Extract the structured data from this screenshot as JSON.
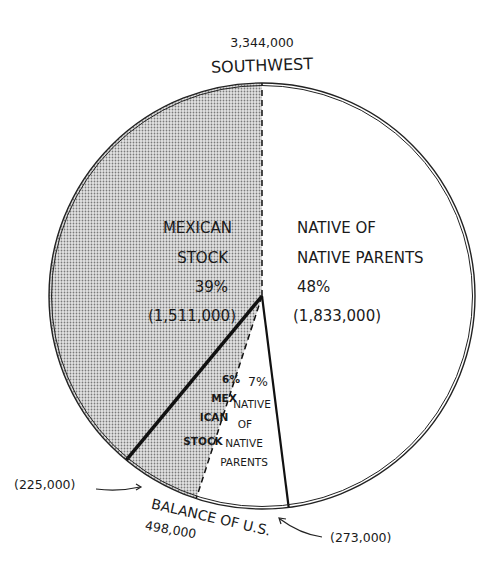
{
  "chart_data": {
    "type": "pie",
    "title": "",
    "start_angle_deg": 0,
    "direction": "clockwise",
    "groups": [
      {
        "name": "Southwest",
        "total_label": "3,344,000",
        "label": "SOUTHWEST",
        "position": "top"
      },
      {
        "name": "Balance of U.S.",
        "total_label": "498,000",
        "label": "BALANCE OF U.S.",
        "position": "bottom",
        "callouts": [
          {
            "text": "(225,000)",
            "side": "left",
            "refers_to": "Mexican stock (balance of U.S.)"
          },
          {
            "text": "(273,000)",
            "side": "right",
            "refers_to": "Native of native parents (balance of U.S.)"
          }
        ]
      }
    ],
    "slices": [
      {
        "group": "Southwest",
        "name": "Native of native parents",
        "percent": 48,
        "value": 1833000,
        "lines": [
          "NATIVE OF",
          "NATIVE PARENTS",
          "48%",
          "(1,833,000)"
        ],
        "fill": "#ffffff",
        "pattern": "none"
      },
      {
        "group": "Balance of U.S.",
        "name": "Native of native parents",
        "percent": 7,
        "value": 273000,
        "lines": [
          "7%",
          "NATIVE",
          "OF",
          "NATIVE",
          "PARENTS"
        ],
        "fill": "#ffffff",
        "pattern": "none"
      },
      {
        "group": "Balance of U.S.",
        "name": "Mexican stock",
        "percent": 6,
        "value": 225000,
        "lines": [
          "6%",
          "MEX",
          "ICAN",
          "STOCK"
        ],
        "fill": "#cfcfcf",
        "pattern": "dots"
      },
      {
        "group": "Southwest",
        "name": "Mexican stock",
        "percent": 39,
        "value": 1511000,
        "lines": [
          "MEXICAN",
          "STOCK",
          "39%",
          "(1,511,000)"
        ],
        "fill": "#cfcfcf",
        "pattern": "dots"
      }
    ],
    "dividers": [
      {
        "between": [
          "Mexican stock (Southwest)",
          "Native of native parents (Southwest)"
        ],
        "style": "dashed"
      },
      {
        "between": [
          "Native of native parents (Southwest)",
          "Native of native parents (Balance)"
        ],
        "style": "solid"
      },
      {
        "between": [
          "Native of native parents (Balance)",
          "Mexican stock (Balance)"
        ],
        "style": "dashed"
      },
      {
        "between": [
          "Mexican stock (Balance)",
          "Mexican stock (Southwest)"
        ],
        "style": "thick-solid"
      }
    ]
  }
}
